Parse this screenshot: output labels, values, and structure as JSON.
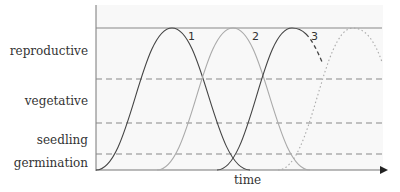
{
  "diagram": {
    "y_labels": [
      {
        "text": "reproductive",
        "y": 55
      },
      {
        "text": "vegetative",
        "y": 105
      },
      {
        "text": "seedling",
        "y": 144
      },
      {
        "text": "germination",
        "y": 167
      }
    ],
    "x_label": "time",
    "curve_labels": [
      "1",
      "2",
      "3"
    ],
    "colors": {
      "axis": "#777777",
      "curve_dark": "#444444",
      "curve_light": "#aaaaaa",
      "dashed": "#888888",
      "bg": "#f7f7f7"
    }
  }
}
